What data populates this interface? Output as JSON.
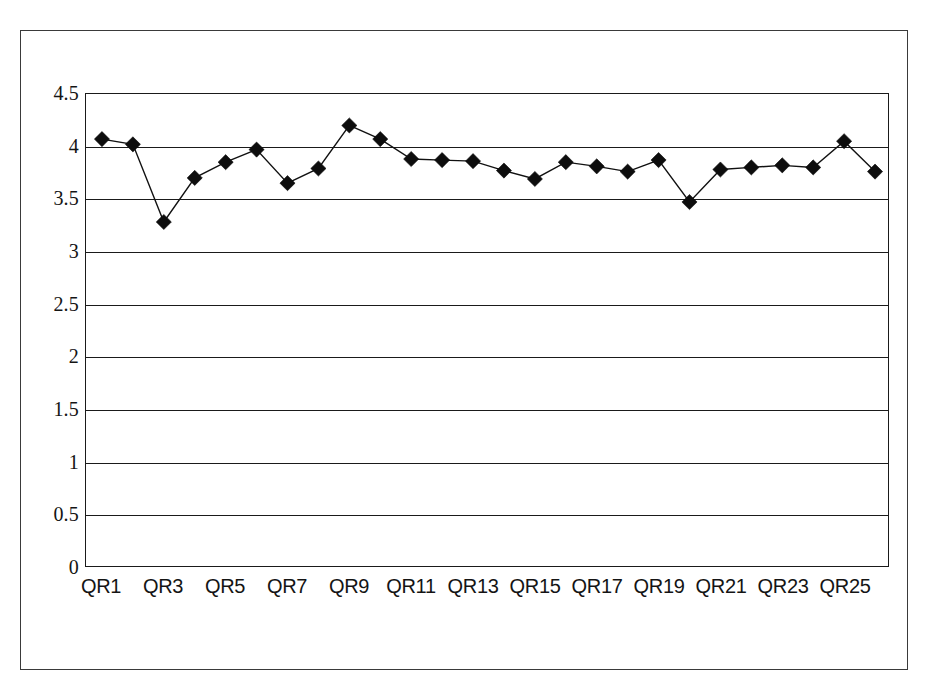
{
  "chart_data": {
    "type": "line",
    "title": "",
    "subtitle": "",
    "xlabel": "",
    "ylabel": "",
    "categories": [
      "QR1",
      "QR2",
      "QR3",
      "QR4",
      "QR5",
      "QR6",
      "QR7",
      "QR8",
      "QR9",
      "QR10",
      "QR11",
      "QR12",
      "QR13",
      "QR14",
      "QR15",
      "QR16",
      "QR17",
      "QR18",
      "QR19",
      "QR20",
      "QR21",
      "QR22",
      "QR23",
      "QR24",
      "QR25",
      "QR26"
    ],
    "values": [
      4.07,
      4.02,
      3.28,
      3.7,
      3.85,
      3.97,
      3.65,
      3.79,
      4.2,
      4.07,
      3.88,
      3.87,
      3.86,
      3.77,
      3.69,
      3.85,
      3.81,
      3.76,
      3.87,
      3.47,
      3.78,
      3.8,
      3.82,
      3.8,
      4.05,
      3.76
    ],
    "series": [
      {
        "name": "QR score",
        "marker": "diamond",
        "marker_color": "#0d0d0d",
        "line_color": "#111111",
        "values": [
          4.07,
          4.02,
          3.28,
          3.7,
          3.85,
          3.97,
          3.65,
          3.79,
          4.2,
          4.07,
          3.88,
          3.87,
          3.86,
          3.77,
          3.69,
          3.85,
          3.81,
          3.76,
          3.87,
          3.47,
          3.78,
          3.8,
          3.82,
          3.8,
          4.05,
          3.76
        ]
      }
    ],
    "y_ticks": [
      "0",
      "0.5",
      "1",
      "1.5",
      "2",
      "2.5",
      "3",
      "3.5",
      "4",
      "4.5"
    ],
    "y_tick_values": [
      0,
      0.5,
      1,
      1.5,
      2,
      2.5,
      3,
      3.5,
      4,
      4.5
    ],
    "ylim": [
      0,
      4.5
    ],
    "x_tick_labels": [
      "QR1",
      "QR3",
      "QR5",
      "QR7",
      "QR9",
      "QR11",
      "QR13",
      "QR15",
      "QR17",
      "QR19",
      "QR21",
      "QR23",
      "QR25"
    ],
    "x_tick_indices": [
      0,
      2,
      4,
      6,
      8,
      10,
      12,
      14,
      16,
      18,
      20,
      22,
      24
    ],
    "grid": {
      "horizontal": true,
      "vertical": false,
      "color": "#1a1a1a"
    },
    "legend": {
      "visible": false,
      "position": "none",
      "entries": []
    },
    "plot_border": true,
    "background_color": "#ffffff",
    "frame_color": "#3a3a3a"
  }
}
